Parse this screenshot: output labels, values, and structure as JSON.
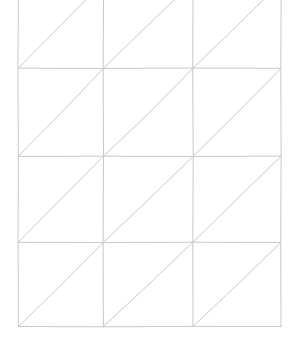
{
  "figure": {
    "background_color": "#ffffff",
    "canvas": {
      "width": 305,
      "height": 340
    }
  },
  "chart_data": {
    "type": "diagram",
    "subtype": "triangulated-grid-mesh",
    "grid": {
      "columns": 3,
      "rows": 4,
      "cell_width": 87.7,
      "cell_height": 85.8,
      "top_row_clipped": true,
      "diagonal_direction": "bottom-left-to-top-right",
      "diagonals_per_cell": 1,
      "total_cells": 12,
      "total_triangles": 24
    },
    "axis_ranges": {
      "x": [
        18,
        281
      ],
      "y": [
        -17,
        326
      ]
    },
    "vertical_line_x": [
      18,
      103,
      193,
      281
    ],
    "horizontal_line_y": [
      -17,
      68,
      156,
      242,
      326
    ],
    "style": {
      "stroke_color": "#c9c9c9",
      "stroke_width": 1,
      "hand_drawn": true,
      "grid": true,
      "legend": "none",
      "axis_labels": "none",
      "tick_labels": "none"
    },
    "xlabel": "",
    "ylabel": "",
    "legend_entries": [],
    "annotations": []
  },
  "geometry": {
    "stroke_color": "#c9c9c9",
    "stroke_width": "1",
    "vertical_lines": [
      {
        "name": "vertical-line-0",
        "d": "M 18.4 -18 L 18.0 68.2 L 18.3 156.4 L 18.1 242.3 L 18.4 326.5"
      },
      {
        "name": "vertical-line-1",
        "d": "M 103.6 -18 L 103.2 68.4 L 103.5 156.2 L 103.1 242.6 L 103.4 326.8"
      },
      {
        "name": "vertical-line-2",
        "d": "M 193.1 -18 L 192.7 68.1 L 193.2 156.5 L 192.8 242.2 L 193.0 326.4"
      },
      {
        "name": "vertical-line-3",
        "d": "M 281.2 -18 L 280.8 68.3 L 281.1 156.1 L 280.7 242.5 L 281.0 326.6"
      }
    ],
    "horizontal_lines": [
      {
        "name": "horizontal-line-1",
        "d": "M 18.0 68.2 L 103.2 68.4 L 192.7 68.1 L 280.8 68.3"
      },
      {
        "name": "horizontal-line-2",
        "d": "M 18.3 156.4 L 103.5 156.2 L 193.2 156.5 L 281.1 156.1"
      },
      {
        "name": "horizontal-line-3",
        "d": "M 18.1 242.3 L 103.1 242.6 L 192.8 242.2 L 280.7 242.5"
      },
      {
        "name": "horizontal-line-4",
        "d": "M 18.4 326.5 L 103.4 326.8 L 193.0 326.4 L 281.0 326.6"
      }
    ],
    "diagonals": [
      {
        "name": "diagonal-r0-c0",
        "d": "M 18.4 68.2 L 60 26 L 103.6 -18"
      },
      {
        "name": "diagonal-r0-c1",
        "d": "M 103.4 68.4 L 148 25 L 193.1 -18"
      },
      {
        "name": "diagonal-r0-c2",
        "d": "M 192.9 68.1 L 237 26 L 281.2 -18"
      },
      {
        "name": "diagonal-r1-c0",
        "d": "M 18.2 156.4 L 61 113 L 103.5 68.4"
      },
      {
        "name": "diagonal-r1-c1",
        "d": "M 103.4 156.3 L 149 113 L 193.0 68.2"
      },
      {
        "name": "diagonal-r1-c2",
        "d": "M 193.1 156.4 L 238 112 L 281.0 68.3"
      },
      {
        "name": "diagonal-r2-c0",
        "d": "M 18.2 242.4 L 60 200 L 103.3 156.3"
      },
      {
        "name": "diagonal-r2-c1",
        "d": "M 103.2 242.5 L 148 200 L 193.1 156.4"
      },
      {
        "name": "diagonal-r2-c2",
        "d": "M 192.9 242.3 L 237 199 L 281.1 156.2"
      },
      {
        "name": "diagonal-r3-c0",
        "d": "M 18.4 326.5 L 61 285 L 103.2 242.6"
      },
      {
        "name": "diagonal-r3-c1",
        "d": "M 103.3 326.7 L 148 285 L 192.9 242.3"
      },
      {
        "name": "diagonal-r3-c2",
        "d": "M 193.0 326.4 L 238 284 L 280.8 242.5"
      }
    ]
  }
}
